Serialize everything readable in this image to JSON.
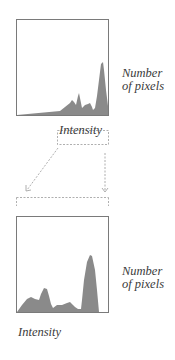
{
  "diagram": {
    "top_histogram": {
      "y_label_line1": "Number",
      "y_label_line2": "of pixels",
      "x_label": "Intensity"
    },
    "bottom_histogram": {
      "y_label_line1": "Number",
      "y_label_line2": "of pixels",
      "x_label": "Intensity"
    },
    "colors": {
      "fill": "#8a8a8a",
      "frame": "#7a7a7a",
      "dashed": "#9a9a9a",
      "text": "#3a3a3a"
    }
  }
}
